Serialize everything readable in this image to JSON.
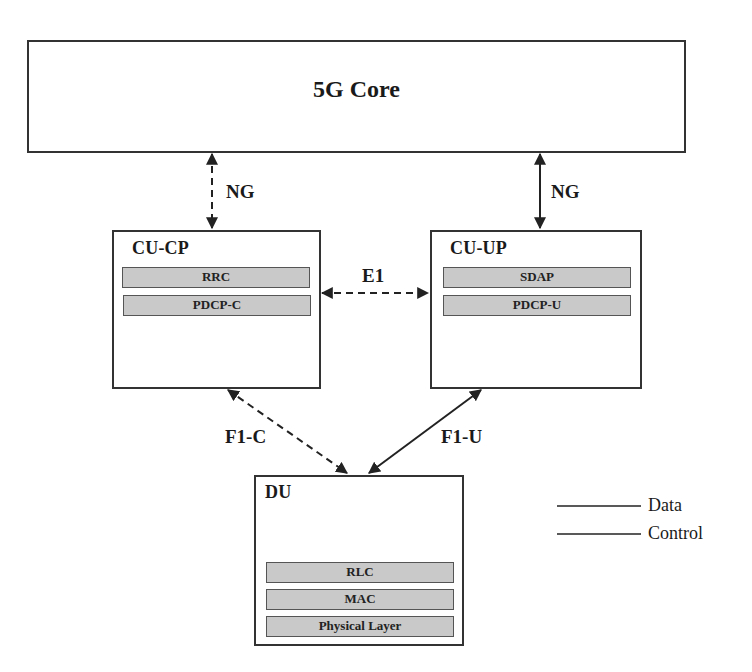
{
  "diagram": {
    "core": {
      "title": "5G Core"
    },
    "cu_cp": {
      "title": "CU-CP",
      "layers": [
        "RRC",
        "PDCP-C"
      ]
    },
    "cu_up": {
      "title": "CU-UP",
      "layers": [
        "SDAP",
        "PDCP-U"
      ]
    },
    "du": {
      "title": "DU",
      "layers": [
        "RLC",
        "MAC",
        "Physical Layer"
      ]
    },
    "interfaces": {
      "ng_control": {
        "label": "NG",
        "style": "dashed",
        "from": "5G Core",
        "to": "CU-CP"
      },
      "ng_data": {
        "label": "NG",
        "style": "solid",
        "from": "5G Core",
        "to": "CU-UP"
      },
      "e1": {
        "label": "E1",
        "style": "dashed",
        "from": "CU-CP",
        "to": "CU-UP"
      },
      "f1_c": {
        "label": "F1-C",
        "style": "dashed",
        "from": "CU-CP",
        "to": "DU"
      },
      "f1_u": {
        "label": "F1-U",
        "style": "solid",
        "from": "CU-UP",
        "to": "DU"
      }
    },
    "legend": [
      {
        "label": "Data",
        "style": "solid"
      },
      {
        "label": "Control",
        "style": "solid"
      }
    ]
  },
  "colors": {
    "stroke": "#222222",
    "layer_fill": "#c9c9c9",
    "background": "#ffffff"
  }
}
